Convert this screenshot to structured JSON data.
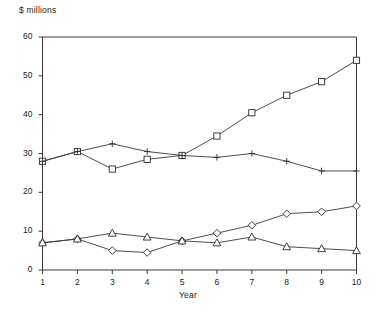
{
  "chart_data": {
    "type": "line",
    "title": "",
    "ylabel": "$ millions",
    "xlabel": "Year",
    "x": [
      1,
      2,
      3,
      4,
      5,
      6,
      7,
      8,
      9,
      10
    ],
    "xlim": [
      1,
      10
    ],
    "ylim": [
      0,
      60
    ],
    "yticks": [
      0,
      10,
      20,
      30,
      40,
      50,
      60
    ],
    "xticks": [
      1,
      2,
      3,
      4,
      5,
      6,
      7,
      8,
      9,
      10
    ],
    "grid": false,
    "legend": "none",
    "series": [
      {
        "name": "square-series",
        "marker": "square",
        "values": [
          28,
          30.5,
          26,
          28.5,
          29.5,
          34.5,
          40.5,
          45,
          48.5,
          54
        ]
      },
      {
        "name": "plus-series",
        "marker": "plus",
        "values": [
          28,
          30.5,
          32.5,
          30.5,
          29.5,
          29,
          30,
          28,
          25.5,
          25.5
        ]
      },
      {
        "name": "diamond-series",
        "marker": "diamond",
        "values": [
          7,
          8,
          5,
          4.5,
          7.5,
          9.5,
          11.5,
          14.5,
          15,
          16.5
        ]
      },
      {
        "name": "triangle-series",
        "marker": "triangle",
        "values": [
          7,
          8,
          9.5,
          8.5,
          7.5,
          7,
          8.5,
          6,
          5.5,
          5
        ]
      }
    ]
  },
  "axis": {
    "y_tick_labels": [
      "60",
      "50",
      "40",
      "30",
      "20",
      "10",
      "0"
    ],
    "x_tick_labels": [
      "1",
      "2",
      "3",
      "4",
      "5",
      "6",
      "7",
      "8",
      "9",
      "10"
    ],
    "y_title": "$ millions",
    "x_title": "Year"
  },
  "colors": {
    "line": "#3a3a3a",
    "marker_stroke": "#2b2b2b",
    "marker_fill": "#ffffff",
    "background": "#ffffff",
    "text": "#1a1a1a"
  }
}
